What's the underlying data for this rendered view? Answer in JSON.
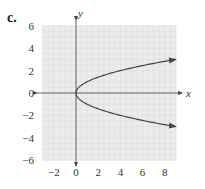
{
  "figure_label": "c.",
  "chart_data": {
    "type": "line",
    "title": "",
    "xlabel": "x",
    "ylabel": "y",
    "xlim": [
      -3,
      9
    ],
    "ylim": [
      -6,
      6
    ],
    "grid": true,
    "x_ticks": [
      -2,
      0,
      2,
      4,
      6,
      8
    ],
    "y_ticks": [
      -6,
      -4,
      -2,
      0,
      2,
      4,
      6
    ],
    "x_tick_labels": [
      "−2",
      "0",
      "2",
      "4",
      "6",
      "8"
    ],
    "y_tick_labels": [
      "6",
      "4",
      "2",
      "0",
      "−2",
      "−4",
      "−6"
    ],
    "series": [
      {
        "name": "x = y^2",
        "equation": "x = y^2",
        "x": [
          9,
          6.25,
          4,
          2.25,
          1,
          0.25,
          0,
          0.25,
          1,
          2.25,
          4,
          6.25,
          9
        ],
        "y": [
          3,
          2.5,
          2,
          1.5,
          1,
          0.5,
          0,
          -0.5,
          -1,
          -1.5,
          -2,
          -2.5,
          -3
        ],
        "arrows_at_ends": true
      }
    ],
    "legend": "none"
  },
  "colors": {
    "grid_bg": "#ececec",
    "grid_line": "#d6d6d6",
    "axis": "#444444",
    "curve": "#444444"
  }
}
